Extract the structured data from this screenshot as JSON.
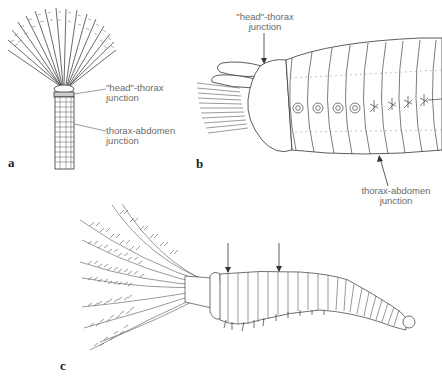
{
  "figure": {
    "panels": [
      {
        "id": "a",
        "label": "a",
        "annotations": [
          {
            "line1": "\"head\"-thorax",
            "line2": "junction"
          },
          {
            "line1": "thorax-abdomen",
            "line2": "junction"
          }
        ]
      },
      {
        "id": "b",
        "label": "b",
        "annotations": [
          {
            "line1": "\"head\"-thorax",
            "line2": "junction"
          },
          {
            "line1": "thorax-abdomen",
            "line2": "junction"
          }
        ]
      },
      {
        "id": "c",
        "label": "c",
        "arrows": 2
      }
    ],
    "colors": {
      "ink": "#2a2a2a",
      "label_text": "#6a6a6a",
      "background": "#ffffff"
    }
  }
}
